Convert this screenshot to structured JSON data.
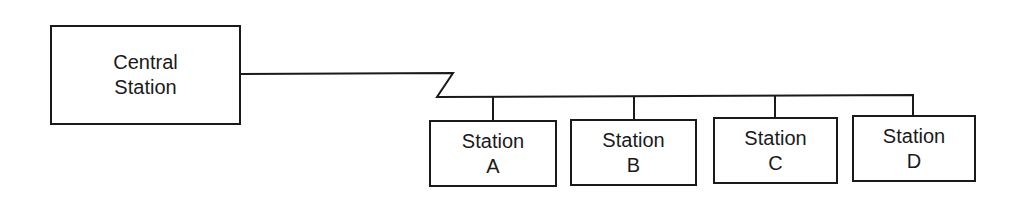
{
  "diagram": {
    "type": "network-topology",
    "central": {
      "line1": "Central",
      "line2": "Station"
    },
    "stations": [
      {
        "line1": "Station",
        "line2": "A"
      },
      {
        "line1": "Station",
        "line2": "B"
      },
      {
        "line1": "Station",
        "line2": "C"
      },
      {
        "line1": "Station",
        "line2": "D"
      }
    ],
    "edges": [
      {
        "from": "Central Station",
        "to": "bus"
      },
      {
        "from": "bus",
        "to": "Station A"
      },
      {
        "from": "bus",
        "to": "Station B"
      },
      {
        "from": "bus",
        "to": "Station C"
      },
      {
        "from": "bus",
        "to": "Station D"
      }
    ],
    "colors": {
      "line": "#1a1a1a",
      "background": "#ffffff"
    }
  }
}
